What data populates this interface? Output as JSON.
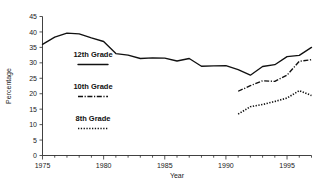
{
  "chart_data": {
    "type": "line",
    "title": "",
    "xlabel": "Year",
    "ylabel": "Percentage",
    "xlim": [
      1975,
      1997
    ],
    "ylim": [
      0,
      45
    ],
    "grid": false,
    "legend_position": "inside-left",
    "xticks": [
      1975,
      1980,
      1985,
      1990,
      1995
    ],
    "xtick_labels": [
      "1975",
      "1980",
      "1985",
      "1990",
      "1995"
    ],
    "xminor_step": 1,
    "yticks": [
      0,
      5,
      10,
      15,
      20,
      25,
      30,
      35,
      40,
      45
    ],
    "ytick_labels": [
      "0",
      "5",
      "10",
      "15",
      "20",
      "25",
      "30",
      "35",
      "40",
      "45"
    ],
    "series": [
      {
        "name": "12th Grade",
        "style": "solid",
        "x": [
          1975,
          1976,
          1977,
          1978,
          1979,
          1980,
          1981,
          1982,
          1983,
          1984,
          1985,
          1986,
          1987,
          1988,
          1989,
          1990,
          1991,
          1992,
          1993,
          1994,
          1995,
          1996,
          1997
        ],
        "values": [
          36.0,
          38.3,
          39.6,
          39.4,
          38.1,
          36.9,
          33.0,
          32.5,
          31.4,
          31.6,
          31.5,
          30.6,
          31.4,
          28.9,
          29.0,
          29.1,
          27.8,
          26.0,
          28.8,
          29.4,
          32.0,
          32.4,
          35.0
        ]
      },
      {
        "name": "10th Grade",
        "style": "dash-dot",
        "x": [
          1991,
          1992,
          1993,
          1994,
          1995,
          1996,
          1997
        ],
        "values": [
          20.8,
          22.6,
          24.2,
          24.0,
          26.0,
          30.5,
          31.0
        ]
      },
      {
        "name": "8th Grade",
        "style": "dotted",
        "x": [
          1991,
          1992,
          1993,
          1994,
          1995,
          1996,
          1997
        ],
        "values": [
          13.4,
          15.8,
          16.5,
          17.5,
          18.6,
          21.0,
          19.4
        ]
      }
    ]
  },
  "legend": {
    "entries": [
      {
        "label": "12th Grade",
        "style": "solid"
      },
      {
        "label": "10th Grade",
        "style": "dash-dot"
      },
      {
        "label": "8th Grade",
        "style": "dotted"
      }
    ]
  },
  "colors": {
    "ink": "#111111",
    "axis": "#2b2b2b",
    "background": "#ffffff"
  }
}
